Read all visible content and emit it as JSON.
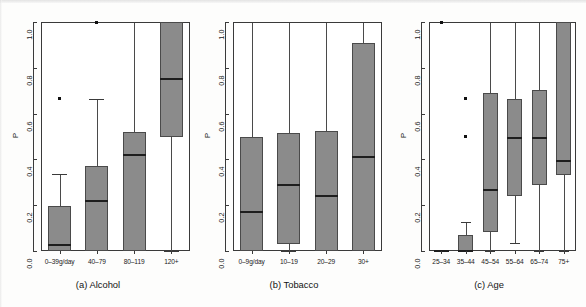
{
  "figure": {
    "y_axis_label": "P",
    "y_ticks": [
      "0.0",
      "0.2",
      "0.4",
      "0.6",
      "0.8",
      "1.0"
    ],
    "y_tick_values": [
      0.0,
      0.2,
      0.4,
      0.6,
      0.8,
      1.0
    ],
    "box_fill_color": "#8b8b8b",
    "box_border_color": "#4a4a4a",
    "median_color": "#1e1e1e",
    "outlier_color": "#111111"
  },
  "chart_data": [
    {
      "type": "box",
      "panel": "a",
      "title": "(a) Alcohol",
      "xlabel": "",
      "ylabel": "P",
      "ylim": [
        0.0,
        1.0
      ],
      "grid": false,
      "legend": "none",
      "categories": [
        "0–39g/day",
        "40–79",
        "80–119",
        "120+"
      ],
      "boxes": [
        {
          "category": "0–39g/day",
          "whisker_low": 0.0,
          "q1": 0.0,
          "median": 0.025,
          "q3": 0.195,
          "whisker_high": 0.335,
          "outliers": [
            0.665
          ]
        },
        {
          "category": "40–79",
          "whisker_low": 0.0,
          "q1": 0.0,
          "median": 0.22,
          "q3": 0.37,
          "whisker_high": 0.665,
          "outliers": [
            1.0
          ]
        },
        {
          "category": "80–119",
          "whisker_low": 0.0,
          "q1": 0.0,
          "median": 0.42,
          "q3": 0.52,
          "whisker_high": 1.0,
          "outliers": []
        },
        {
          "category": "120+",
          "whisker_low": 0.0,
          "q1": 0.5,
          "median": 0.75,
          "q3": 1.0,
          "whisker_high": 1.0,
          "outliers": []
        }
      ]
    },
    {
      "type": "box",
      "panel": "b",
      "title": "(b) Tobacco",
      "xlabel": "",
      "ylabel": "P",
      "ylim": [
        0.0,
        1.0
      ],
      "grid": false,
      "legend": "none",
      "categories": [
        "0–9g/day",
        "10–19",
        "20–29",
        "30+"
      ],
      "boxes": [
        {
          "category": "0–9g/day",
          "whisker_low": 0.0,
          "q1": 0.0,
          "median": 0.17,
          "q3": 0.5,
          "whisker_high": 1.0,
          "outliers": []
        },
        {
          "category": "10–19",
          "whisker_low": 0.0,
          "q1": 0.03,
          "median": 0.29,
          "q3": 0.515,
          "whisker_high": 1.0,
          "outliers": []
        },
        {
          "category": "20–29",
          "whisker_low": 0.0,
          "q1": 0.0,
          "median": 0.24,
          "q3": 0.525,
          "whisker_high": 1.0,
          "outliers": []
        },
        {
          "category": "30+",
          "whisker_low": 0.0,
          "q1": 0.0,
          "median": 0.41,
          "q3": 0.91,
          "whisker_high": 1.0,
          "outliers": []
        }
      ]
    },
    {
      "type": "box",
      "panel": "c",
      "title": "(c) Age",
      "xlabel": "",
      "ylabel": "P",
      "ylim": [
        0.0,
        1.0
      ],
      "grid": false,
      "legend": "none",
      "categories": [
        "25–34",
        "35–44",
        "45–54",
        "55–64",
        "65–74",
        "75+"
      ],
      "boxes": [
        {
          "category": "25–34",
          "whisker_low": 0.0,
          "q1": 0.0,
          "median": 0.0,
          "q3": 0.0,
          "whisker_high": 0.0,
          "outliers": [
            1.0
          ]
        },
        {
          "category": "35–44",
          "whisker_low": 0.0,
          "q1": 0.0,
          "median": 0.0,
          "q3": 0.07,
          "whisker_high": 0.125,
          "outliers": [
            0.667,
            0.5
          ]
        },
        {
          "category": "45–54",
          "whisker_low": 0.0,
          "q1": 0.085,
          "median": 0.265,
          "q3": 0.69,
          "whisker_high": 1.0,
          "outliers": []
        },
        {
          "category": "55–64",
          "whisker_low": 0.035,
          "q1": 0.24,
          "median": 0.495,
          "q3": 0.665,
          "whisker_high": 1.0,
          "outliers": []
        },
        {
          "category": "65–74",
          "whisker_low": 0.0,
          "q1": 0.29,
          "median": 0.495,
          "q3": 0.705,
          "whisker_high": 1.0,
          "outliers": []
        },
        {
          "category": "75+",
          "whisker_low": 0.0,
          "q1": 0.33,
          "median": 0.395,
          "q3": 1.0,
          "whisker_high": 1.0,
          "outliers": []
        }
      ]
    }
  ]
}
